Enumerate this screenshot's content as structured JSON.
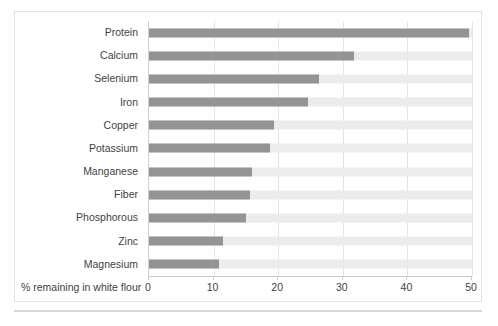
{
  "chart_data": {
    "type": "bar",
    "orientation": "horizontal",
    "title": "",
    "xlabel": "% remaining in white flour",
    "ylabel": "",
    "xlim": [
      0,
      50
    ],
    "xticks": [
      0,
      10,
      20,
      30,
      40,
      50
    ],
    "xtick_labels": [
      "0",
      "10",
      "20",
      "30",
      "40",
      "50"
    ],
    "grid": "vertical",
    "legend": "none",
    "track_max": 50,
    "categories": [
      "Protein",
      "Calcium",
      "Selenium",
      "Iron",
      "Copper",
      "Potassium",
      "Manganese",
      "Fiber",
      "Phosphorous",
      "Zinc",
      "Magnesium"
    ],
    "values": [
      49.5,
      31.8,
      26.3,
      24.6,
      19.4,
      18.7,
      16.0,
      15.6,
      15.0,
      11.4,
      10.8
    ],
    "colors": {
      "bar_fill": "#949494",
      "bar_track": "#ececec",
      "gridline": "#e4e4e4",
      "axis_line": "#c9c9c9",
      "frame": "#e2e2e2",
      "text": "#3f3f3f"
    }
  },
  "caption": {
    "text": ""
  }
}
